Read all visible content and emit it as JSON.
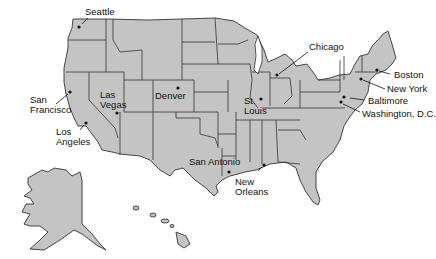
{
  "map": {
    "type": "United States map with major cities",
    "fill_color": "#c4c4c4",
    "border_color": "#333333",
    "background_color": "#ffffff",
    "cities": [
      {
        "name": "Seattle",
        "label": "Seattle"
      },
      {
        "name": "San Francisco",
        "label_line1": "San",
        "label_line2": "Francisco"
      },
      {
        "name": "Los Angeles",
        "label_line1": "Los",
        "label_line2": "Angeles"
      },
      {
        "name": "Las Vegas",
        "label_line1": "Las",
        "label_line2": "Vegas"
      },
      {
        "name": "Denver",
        "label": "Denver"
      },
      {
        "name": "San Antonio",
        "label": "San Antonio"
      },
      {
        "name": "St. Louis",
        "label_line1": "St.",
        "label_line2": "Louis"
      },
      {
        "name": "Chicago",
        "label": "Chicago"
      },
      {
        "name": "New Orleans",
        "label_line1": "New",
        "label_line2": "Orleans"
      },
      {
        "name": "Boston",
        "label": "Boston"
      },
      {
        "name": "New York",
        "label": "New York"
      },
      {
        "name": "Baltimore",
        "label": "Baltimore"
      },
      {
        "name": "Washington, D.C.",
        "label": "Washington, D.C."
      }
    ],
    "insets": [
      "Alaska",
      "Hawaii"
    ]
  }
}
